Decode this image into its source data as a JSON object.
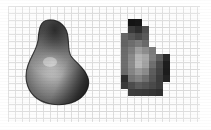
{
  "figure": {
    "width": 211,
    "height": 130,
    "background_color": "#ffffff",
    "caption": ""
  },
  "grid": {
    "name": "sampling-grid",
    "left": 8,
    "top": 6,
    "width": 192,
    "height": 116,
    "cell_size": 7,
    "line_color": "#c9c9c9",
    "fill_color": "#fdfdfd",
    "columns": 27,
    "rows": 16
  },
  "smooth_shape": {
    "name": "smooth-shaded-blob",
    "label": "",
    "left": 22,
    "top": 18,
    "width": 70,
    "height": 88,
    "outline_color": "#1a1a1a",
    "highlight_color": "#f2f2f2",
    "shadow_color": "#151515",
    "midtone_color": "#8a8a8a",
    "highlight_center": {
      "x": 30,
      "y": 44
    }
  },
  "pixel_shape": {
    "name": "quantized-pixel-blob",
    "label": "",
    "left": 121,
    "top": 19,
    "width": 62,
    "height": 84,
    "cell_size": 7,
    "cells": [
      {
        "col": 1,
        "row": 0,
        "gray": "#141414"
      },
      {
        "col": 2,
        "row": 0,
        "gray": "#171717"
      },
      {
        "col": 1,
        "row": 1,
        "gray": "#3a3a3a"
      },
      {
        "col": 2,
        "row": 1,
        "gray": "#2d2d2d"
      },
      {
        "col": 3,
        "row": 1,
        "gray": "#4f4f4f"
      },
      {
        "col": 0,
        "row": 2,
        "gray": "#666666"
      },
      {
        "col": 1,
        "row": 2,
        "gray": "#565656"
      },
      {
        "col": 2,
        "row": 2,
        "gray": "#4a4a4a"
      },
      {
        "col": 3,
        "row": 2,
        "gray": "#5a5a5a"
      },
      {
        "col": 0,
        "row": 3,
        "gray": "#636363"
      },
      {
        "col": 1,
        "row": 3,
        "gray": "#6e6e6e"
      },
      {
        "col": 2,
        "row": 3,
        "gray": "#7b7b7b"
      },
      {
        "col": 3,
        "row": 3,
        "gray": "#6a6a6a"
      },
      {
        "col": 0,
        "row": 4,
        "gray": "#6b6b6b"
      },
      {
        "col": 1,
        "row": 4,
        "gray": "#7d7d7d"
      },
      {
        "col": 2,
        "row": 4,
        "gray": "#9e9e9e"
      },
      {
        "col": 3,
        "row": 4,
        "gray": "#8d8d8d"
      },
      {
        "col": 4,
        "row": 4,
        "gray": "#7a7a7a"
      },
      {
        "col": 0,
        "row": 5,
        "gray": "#6d6d6d"
      },
      {
        "col": 1,
        "row": 5,
        "gray": "#8a8a8a"
      },
      {
        "col": 2,
        "row": 5,
        "gray": "#b4b4b4"
      },
      {
        "col": 3,
        "row": 5,
        "gray": "#a8a8a8"
      },
      {
        "col": 4,
        "row": 5,
        "gray": "#7f7f7f"
      },
      {
        "col": 5,
        "row": 5,
        "gray": "#5e5e5e"
      },
      {
        "col": 6,
        "row": 5,
        "gray": "#2a2a2a"
      },
      {
        "col": 0,
        "row": 6,
        "gray": "#6e6e6e"
      },
      {
        "col": 1,
        "row": 6,
        "gray": "#8d8d8d"
      },
      {
        "col": 2,
        "row": 6,
        "gray": "#b8b8b8"
      },
      {
        "col": 3,
        "row": 6,
        "gray": "#a2a2a2"
      },
      {
        "col": 4,
        "row": 6,
        "gray": "#6f6f6f"
      },
      {
        "col": 5,
        "row": 6,
        "gray": "#4a4a4a"
      },
      {
        "col": 6,
        "row": 6,
        "gray": "#1e1e1e"
      },
      {
        "col": 0,
        "row": 7,
        "gray": "#6a6a6a"
      },
      {
        "col": 1,
        "row": 7,
        "gray": "#858585"
      },
      {
        "col": 2,
        "row": 7,
        "gray": "#9a9a9a"
      },
      {
        "col": 3,
        "row": 7,
        "gray": "#8b8b8b"
      },
      {
        "col": 4,
        "row": 7,
        "gray": "#5d5d5d"
      },
      {
        "col": 5,
        "row": 7,
        "gray": "#444444"
      },
      {
        "col": 6,
        "row": 7,
        "gray": "#1c1c1c"
      },
      {
        "col": 0,
        "row": 8,
        "gray": "#2e2e2e"
      },
      {
        "col": 1,
        "row": 8,
        "gray": "#757575"
      },
      {
        "col": 2,
        "row": 8,
        "gray": "#828282"
      },
      {
        "col": 3,
        "row": 8,
        "gray": "#707070"
      },
      {
        "col": 4,
        "row": 8,
        "gray": "#565656"
      },
      {
        "col": 5,
        "row": 8,
        "gray": "#3d3d3d"
      },
      {
        "col": 6,
        "row": 8,
        "gray": "#232323"
      },
      {
        "col": 0,
        "row": 9,
        "gray": "#3a3a3a"
      },
      {
        "col": 1,
        "row": 9,
        "gray": "#4d4d4d"
      },
      {
        "col": 2,
        "row": 9,
        "gray": "#5c5c5c"
      },
      {
        "col": 3,
        "row": 9,
        "gray": "#545454"
      },
      {
        "col": 4,
        "row": 9,
        "gray": "#4a4a4a"
      },
      {
        "col": 5,
        "row": 9,
        "gray": "#3e3e3e"
      },
      {
        "col": 1,
        "row": 10,
        "gray": "#3c3c3c"
      },
      {
        "col": 2,
        "row": 10,
        "gray": "#3a3a3a"
      },
      {
        "col": 3,
        "row": 10,
        "gray": "#383838"
      },
      {
        "col": 4,
        "row": 10,
        "gray": "#343434"
      },
      {
        "col": 5,
        "row": 10,
        "gray": "#2f2f2f"
      }
    ]
  }
}
